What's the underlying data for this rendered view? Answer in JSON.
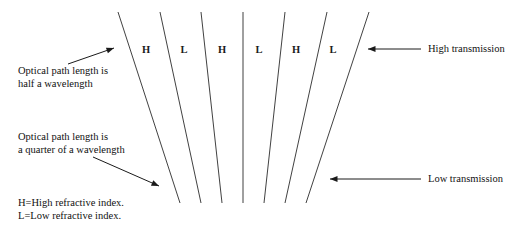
{
  "diagram": {
    "background_color": "#ffffff",
    "line_color": "#2b2b2b",
    "text_color": "#111111",
    "layer_labels": [
      {
        "text": "H",
        "x": 146,
        "y": 50
      },
      {
        "text": "L",
        "x": 184,
        "y": 50
      },
      {
        "text": "H",
        "x": 222,
        "y": 50
      },
      {
        "text": "L",
        "x": 259,
        "y": 50
      },
      {
        "text": "H",
        "x": 296,
        "y": 50
      },
      {
        "text": "L",
        "x": 333,
        "y": 50
      }
    ],
    "notes": [
      {
        "name": "half-wavelength-note",
        "x": 18,
        "y": 64,
        "lines": [
          "Optical path length is",
          "half a wavelength"
        ]
      },
      {
        "name": "quarter-wavelength-note",
        "x": 18,
        "y": 130,
        "lines": [
          "Optical path length is",
          "a quarter of a wavelength"
        ]
      },
      {
        "name": "index-key-note",
        "x": 18,
        "y": 196,
        "lines": [
          "H=High refractive index.",
          "L=Low refractive index."
        ]
      }
    ],
    "side_labels": [
      {
        "name": "high-transmission-label",
        "text": "High transmission",
        "x": 428,
        "y": 49
      },
      {
        "name": "low-transmission-label",
        "text": "Low transmission",
        "x": 428,
        "y": 179
      }
    ],
    "stack": {
      "top_y": 12,
      "bottom_y": 203,
      "top_x": [
        118,
        160,
        201,
        243,
        285,
        327,
        369
      ],
      "bottom_x": [
        180,
        201,
        222,
        243,
        264,
        285,
        306
      ]
    },
    "annotations": {
      "half_wavelength_arrow": {
        "x1": 68,
        "y1": 64,
        "x2": 114,
        "y2": 48
      },
      "quarter_wavelength_arrow": {
        "x1": 93,
        "y1": 157,
        "x2": 159,
        "y2": 186
      },
      "high_transmission_arrow": {
        "x1": 421,
        "y1": 49,
        "x2": 368,
        "y2": 49
      },
      "low_transmission_arrow": {
        "x1": 421,
        "y1": 179,
        "x2": 330,
        "y2": 179
      }
    }
  }
}
